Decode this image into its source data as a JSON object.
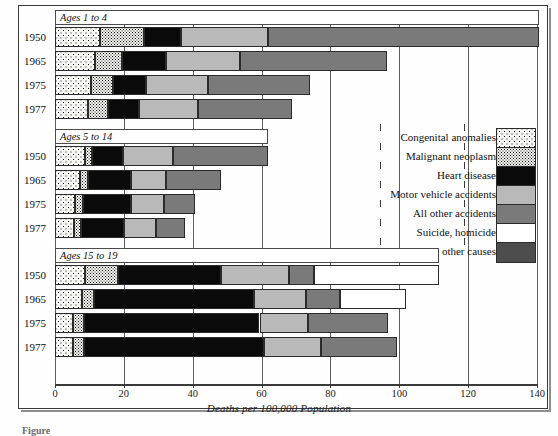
{
  "figure": {
    "xlabel": "Deaths per 100,000 Population",
    "caption_partial": "Figure"
  },
  "axis": {
    "ticks": [
      0,
      20,
      40,
      60,
      80,
      100,
      120,
      140
    ],
    "min": 0,
    "max": 140
  },
  "legend": {
    "items": [
      {
        "label": "Congenital anomalies",
        "key": "congenital",
        "swatch": "coarse-dot-pattern"
      },
      {
        "label": "Malignant neoplasm",
        "key": "malignant",
        "swatch": "fine-speckle-pattern"
      },
      {
        "label": "Heart disease",
        "key": "heart",
        "swatch": "black-fill",
        "color": "#0a0a0a"
      },
      {
        "label": "Motor vehicle accidents",
        "key": "motor",
        "swatch": "light-gray-fill",
        "color": "#b9b9b9"
      },
      {
        "label": "All other accidents",
        "key": "allacc",
        "swatch": "medium-gray-fill",
        "color": "#7a7a7a"
      },
      {
        "label": "Suicide, homicide",
        "key": "suicide",
        "swatch": "white-fill",
        "color": "#ffffff"
      },
      {
        "label": "All other causes",
        "key": "other",
        "swatch": "dark-gray-fill",
        "color": "#4d4d4d"
      }
    ]
  },
  "groups": [
    {
      "label": "Ages 1 to 4",
      "rows": [
        {
          "year": "1950",
          "values": [
            13.1,
            12.8,
            10.8,
            25.1,
            78.7,
            0.0,
            0.0
          ],
          "total": 140.5
        },
        {
          "year": "1965",
          "values": [
            11.7,
            7.9,
            12.5,
            21.6,
            42.6,
            0.0,
            0.0
          ],
          "total": 96.3
        },
        {
          "year": "1975",
          "values": [
            10.5,
            6.4,
            9.6,
            17.8,
            29.8,
            0.0,
            0.0
          ],
          "total": 74.1
        },
        {
          "year": "1977",
          "values": [
            9.6,
            5.8,
            9.0,
            17.2,
            27.2,
            0.0,
            0.0
          ],
          "total": 68.8
        }
      ]
    },
    {
      "label": "Ages 5 to 14",
      "rows": [
        {
          "year": "1950",
          "values": [
            8.7,
            2.0,
            9.0,
            14.6,
            27.7,
            0.0,
            0.0
          ],
          "total": 62.0
        },
        {
          "year": "1965",
          "values": [
            7.3,
            2.3,
            12.5,
            10.2,
            16.0,
            0.0,
            0.0
          ],
          "total": 48.3
        },
        {
          "year": "1975",
          "values": [
            5.8,
            2.3,
            14.0,
            9.6,
            9.0,
            0.0,
            0.0
          ],
          "total": 40.7
        },
        {
          "year": "1977",
          "values": [
            5.5,
            2.0,
            12.5,
            9.3,
            8.4,
            0.0,
            0.0
          ],
          "total": 37.7
        }
      ]
    },
    {
      "label": "Ages 15 to 19",
      "rows": [
        {
          "year": "1950",
          "values": [
            8.7,
            9.6,
            29.8,
            19.8,
            7.3,
            36.2,
            0.0
          ],
          "total": 111.4
        },
        {
          "year": "1965",
          "values": [
            7.9,
            3.5,
            46.3,
            15.2,
            9.9,
            19.2,
            0.0
          ],
          "total": 102.0
        },
        {
          "year": "1975",
          "values": [
            5.2,
            3.2,
            51.0,
            14.0,
            23.3,
            0.0,
            0.0
          ],
          "total": 96.7
        },
        {
          "year": "1977",
          "values": [
            5.2,
            3.2,
            52.2,
            16.6,
            22.1,
            0.0,
            0.0
          ],
          "total": 99.3
        }
      ]
    }
  ],
  "chart_data": {
    "type": "bar",
    "orientation": "horizontal",
    "stacked": true,
    "title": "",
    "xlabel": "Deaths per 100,000 Population",
    "ylabel": "",
    "xlim": [
      0,
      140
    ],
    "xticks": [
      0,
      20,
      40,
      60,
      80,
      100,
      120,
      140
    ],
    "grid": "vertical",
    "legend_position": "right-middle",
    "series": [
      {
        "name": "Congenital anomalies",
        "color": "#f7f7f4",
        "pattern": "coarse-dots",
        "values": [
          13.1,
          11.7,
          10.5,
          9.6,
          8.7,
          7.3,
          5.8,
          5.5,
          8.7,
          7.9,
          5.2,
          5.2
        ]
      },
      {
        "name": "Malignant neoplasm",
        "color": "#f2f2ee",
        "pattern": "fine-speckle",
        "values": [
          12.8,
          7.9,
          6.4,
          5.8,
          2.0,
          2.3,
          2.3,
          2.0,
          9.6,
          3.5,
          3.2,
          3.2
        ]
      },
      {
        "name": "Heart disease",
        "color": "#0a0a0a",
        "pattern": "solid",
        "values": [
          10.8,
          12.5,
          9.6,
          9.0,
          9.0,
          12.5,
          14.0,
          12.5,
          29.8,
          46.3,
          51.0,
          52.2
        ]
      },
      {
        "name": "Motor vehicle accidents",
        "color": "#b9b9b9",
        "pattern": "solid",
        "values": [
          25.1,
          21.6,
          17.8,
          17.2,
          14.6,
          10.2,
          9.6,
          9.3,
          19.8,
          15.2,
          14.0,
          16.6
        ]
      },
      {
        "name": "All other accidents",
        "color": "#7a7a7a",
        "pattern": "solid",
        "values": [
          78.7,
          42.6,
          29.8,
          27.2,
          27.7,
          16.0,
          9.0,
          8.4,
          7.3,
          9.9,
          23.3,
          22.1
        ]
      },
      {
        "name": "Suicide, homicide",
        "color": "#ffffff",
        "pattern": "solid",
        "values": [
          0,
          0,
          0,
          0,
          0,
          0,
          0,
          0,
          36.2,
          19.2,
          0,
          0
        ]
      },
      {
        "name": "All other causes",
        "color": "#4d4d4d",
        "pattern": "solid",
        "values": [
          0,
          0,
          0,
          0,
          0,
          0,
          0,
          0,
          0,
          0,
          0,
          0
        ]
      }
    ],
    "categories": [
      "Ages 1 to 4 / 1950",
      "Ages 1 to 4 / 1965",
      "Ages 1 to 4 / 1975",
      "Ages 1 to 4 / 1977",
      "Ages 5 to 14 / 1950",
      "Ages 5 to 14 / 1965",
      "Ages 5 to 14 / 1975",
      "Ages 5 to 14 / 1977",
      "Ages 15 to 19 / 1950",
      "Ages 15 to 19 / 1965",
      "Ages 15 to 19 / 1975",
      "Ages 15 to 19 / 1977"
    ],
    "totals": [
      140.5,
      96.3,
      74.1,
      68.8,
      62.0,
      48.3,
      40.7,
      37.7,
      111.4,
      102.0,
      96.7,
      99.3
    ]
  }
}
